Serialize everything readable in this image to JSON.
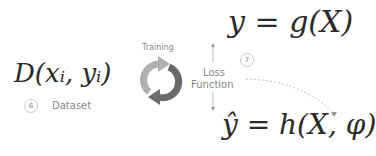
{
  "equations": {
    "target": "y = g(X)",
    "dataset": "D(xᵢ, yᵢ)",
    "prediction": "ŷ = h(X, φ)"
  },
  "labels": {
    "training": "Training",
    "loss_line1": "Loss",
    "loss_line2": "Function",
    "dataset": "Dataset"
  },
  "badges": {
    "dataset_num": "6",
    "loss_num": "7"
  },
  "colors": {
    "arrow_light": "#b0b0b0",
    "arrow_dark": "#6a6a6a"
  }
}
